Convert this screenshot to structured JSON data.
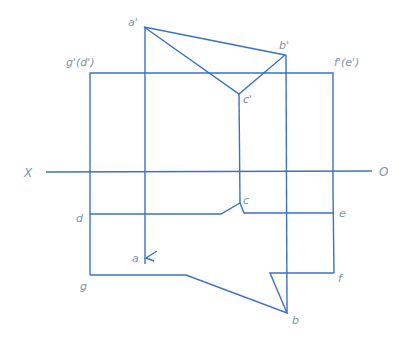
{
  "diagram": {
    "type": "orthographic-projection",
    "line_color": "#3a72c4",
    "label_color": "#7f93ad",
    "axis": {
      "left_label": "X",
      "right_label": "O"
    },
    "labels": {
      "a_prime": "a'",
      "b_prime": "b'",
      "c_prime": "c'",
      "g_prime_d_prime": "g'(d')",
      "f_prime_e_prime": "f'(e')",
      "a": "a",
      "b": "b",
      "c": "c",
      "d": "d",
      "e": "e",
      "f": "f",
      "g": "g"
    }
  }
}
